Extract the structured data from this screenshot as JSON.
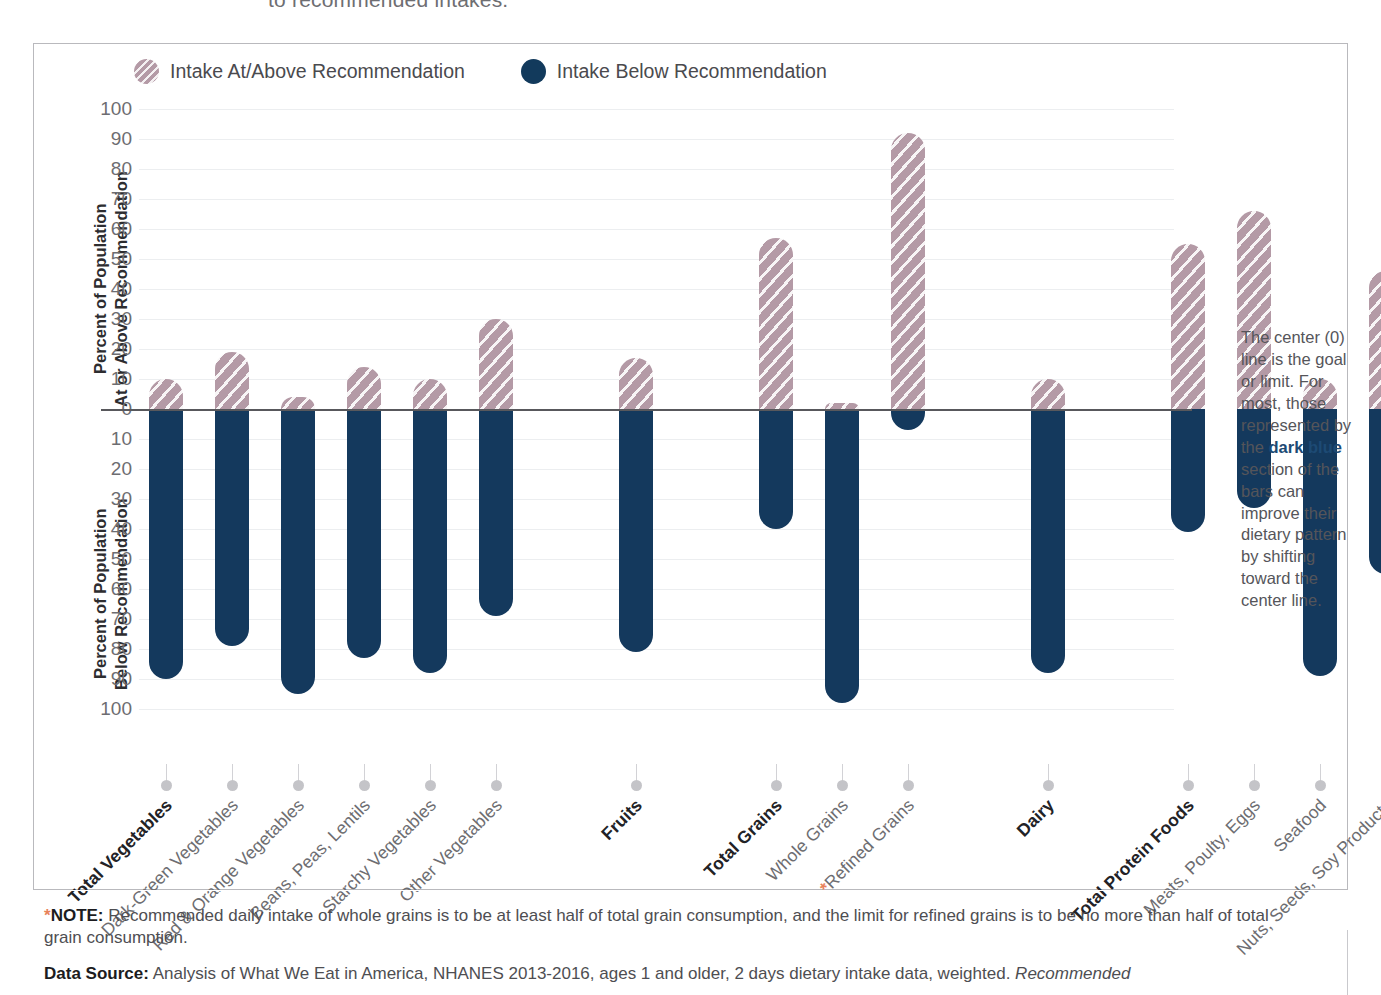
{
  "title_fragment": "to recommended intakes.",
  "legend": [
    {
      "label": "Intake At/Above Recommendation",
      "swatch": "above-circle-icon",
      "color": "#b49aa6"
    },
    {
      "label": "Intake Below Recommendation",
      "swatch": "below-circle-icon",
      "color": "#123a5c"
    }
  ],
  "axis": {
    "upper_title": "Percent of Population\nAt or Above Recommendation",
    "lower_title": "Percent of Population\nBelow Recommendation",
    "upper_ticks": [
      "100",
      "90",
      "80",
      "70",
      "60",
      "50",
      "40",
      "30",
      "20",
      "10",
      "0"
    ],
    "lower_ticks": [
      "10",
      "20",
      "30",
      "40",
      "50",
      "60",
      "70",
      "80",
      "90",
      "100"
    ]
  },
  "sidenote": {
    "before": "The center (0) line is the goal or limit. For most, those represented by the ",
    "emphasis": "dark blue",
    "after": " section of the bars can improve their dietary pattern by shifting toward the center line."
  },
  "footnotes": {
    "note_star": "*",
    "note_label": "NOTE:",
    "note_text": " Recommended daily intake of whole grains is to be at least half of total grain consumption, and the limit for refined grains is to be no more than half of total grain consumption.",
    "source_label": "Data Source:",
    "source_text": " Analysis of What We Eat in America, NHANES 2013-2016, ages 1 and older, 2 days dietary intake data, weighted. ",
    "source_italic": "Recommended"
  },
  "chart_data": {
    "type": "bar",
    "xlabel": "",
    "ylabel": "Percent of Population",
    "ylim": [
      -100,
      100
    ],
    "grid": true,
    "legend_position": "top-left",
    "categories": [
      "Total Vegetables",
      "Dark-Green Vegetables",
      "Red & Orange Vegetables",
      "Beans, Peas, Lentils",
      "Starchy Vegetables",
      "Other Vegetables",
      "Fruits",
      "Total Grains",
      "Whole Grains",
      "Refined Grains",
      "Dairy",
      "Total Protein Foods",
      "Meats, Poulty, Eggs",
      "Seafood",
      "Nuts, Seeds, Soy Products"
    ],
    "series": [
      {
        "name": "Intake At/Above Recommendation",
        "values": [
          10,
          19,
          4,
          14,
          10,
          30,
          17,
          57,
          2,
          92,
          10,
          55,
          66,
          10,
          46
        ]
      },
      {
        "name": "Intake Below Recommendation",
        "values": [
          90,
          79,
          95,
          83,
          88,
          69,
          81,
          40,
          98,
          7,
          88,
          41,
          33,
          89,
          55
        ]
      }
    ],
    "bars": [
      {
        "label": "Total Vegetables",
        "bold": true,
        "group": 0,
        "above": 10,
        "below": 90,
        "asterisk": false
      },
      {
        "label": "Dark-Green Vegetables",
        "bold": false,
        "group": 0,
        "above": 19,
        "below": 79,
        "asterisk": false
      },
      {
        "label": "Red & Orange Vegetables",
        "bold": false,
        "group": 0,
        "above": 4,
        "below": 95,
        "asterisk": false
      },
      {
        "label": "Beans, Peas, Lentils",
        "bold": false,
        "group": 0,
        "above": 14,
        "below": 83,
        "asterisk": false
      },
      {
        "label": "Starchy Vegetables",
        "bold": false,
        "group": 0,
        "above": 10,
        "below": 88,
        "asterisk": false
      },
      {
        "label": "Other Vegetables",
        "bold": false,
        "group": 0,
        "above": 30,
        "below": 69,
        "asterisk": false
      },
      {
        "label": "Fruits",
        "bold": true,
        "group": 1,
        "above": 17,
        "below": 81,
        "asterisk": false
      },
      {
        "label": "Total Grains",
        "bold": true,
        "group": 2,
        "above": 57,
        "below": 40,
        "asterisk": false
      },
      {
        "label": "Whole Grains",
        "bold": false,
        "group": 2,
        "above": 2,
        "below": 98,
        "asterisk": false
      },
      {
        "label": "Refined Grains",
        "bold": false,
        "group": 2,
        "above": 92,
        "below": 7,
        "asterisk": true
      },
      {
        "label": "Dairy",
        "bold": true,
        "group": 3,
        "above": 10,
        "below": 88,
        "asterisk": false
      },
      {
        "label": "Total Protein Foods",
        "bold": true,
        "group": 4,
        "above": 55,
        "below": 41,
        "asterisk": false
      },
      {
        "label": "Meats, Poulty, Eggs",
        "bold": false,
        "group": 4,
        "above": 66,
        "below": 33,
        "asterisk": false
      },
      {
        "label": "Seafood",
        "bold": false,
        "group": 4,
        "above": 10,
        "below": 89,
        "asterisk": false
      },
      {
        "label": "Nuts, Seeds, Soy Products",
        "bold": false,
        "group": 4,
        "above": 46,
        "below": 55,
        "asterisk": false
      }
    ],
    "colors": {
      "above": "#b49aa6",
      "below": "#14395d",
      "zero_line": "#58585c"
    }
  }
}
